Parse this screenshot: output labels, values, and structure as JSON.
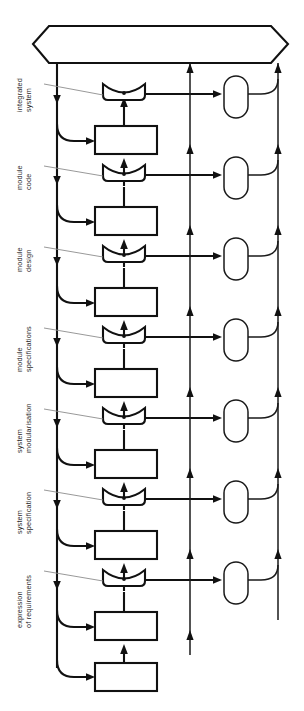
{
  "diagram": {
    "orientation": "rotated-90-counterclockwise",
    "colors": {
      "stroke": "#111111",
      "leader": "#8d8d8d",
      "fill": "#ffffff",
      "label": "#2a2a2a"
    },
    "top_shape": {
      "name": "integrated-system-bus",
      "type": "hexagon",
      "label": ""
    },
    "stage_labels": [
      {
        "id": "integrated-system",
        "line1": "integrated",
        "line2": "system"
      },
      {
        "id": "module-code",
        "line1": "module",
        "line2": "code"
      },
      {
        "id": "module-design",
        "line1": "module",
        "line2": "design"
      },
      {
        "id": "module-specifications",
        "line1": "module",
        "line2": "specifications"
      },
      {
        "id": "system-modularisation",
        "line1": "system",
        "line2": "modularisation"
      },
      {
        "id": "system-specification",
        "line1": "system",
        "line2": "specification"
      },
      {
        "id": "expression-of-requirements",
        "line1": "expression",
        "line2": "of requirements"
      }
    ],
    "process_nodes": [
      {
        "id": "cup-1",
        "type": "cup",
        "label": ""
      },
      {
        "id": "rect-1",
        "type": "rectangle",
        "label": ""
      },
      {
        "id": "cup-2",
        "type": "cup",
        "label": ""
      },
      {
        "id": "rect-2",
        "type": "rectangle",
        "label": ""
      },
      {
        "id": "cup-3",
        "type": "cup",
        "label": ""
      },
      {
        "id": "rect-3",
        "type": "rectangle",
        "label": ""
      },
      {
        "id": "cup-4",
        "type": "cup",
        "label": ""
      },
      {
        "id": "rect-4",
        "type": "rectangle",
        "label": ""
      },
      {
        "id": "cup-5",
        "type": "cup",
        "label": ""
      },
      {
        "id": "rect-5",
        "type": "rectangle",
        "label": ""
      },
      {
        "id": "cup-6",
        "type": "cup",
        "label": ""
      },
      {
        "id": "rect-6",
        "type": "rectangle",
        "label": ""
      },
      {
        "id": "cup-7",
        "type": "cup",
        "label": ""
      },
      {
        "id": "rect-7",
        "type": "rectangle",
        "label": ""
      }
    ],
    "capsule_nodes": [
      {
        "id": "capsule-1",
        "type": "capsule",
        "label": ""
      },
      {
        "id": "capsule-2",
        "type": "capsule",
        "label": ""
      },
      {
        "id": "capsule-3",
        "type": "capsule",
        "label": ""
      },
      {
        "id": "capsule-4",
        "type": "capsule",
        "label": ""
      },
      {
        "id": "capsule-5",
        "type": "capsule",
        "label": ""
      },
      {
        "id": "capsule-6",
        "type": "capsule",
        "label": ""
      },
      {
        "id": "capsule-7",
        "type": "capsule",
        "label": ""
      }
    ]
  }
}
